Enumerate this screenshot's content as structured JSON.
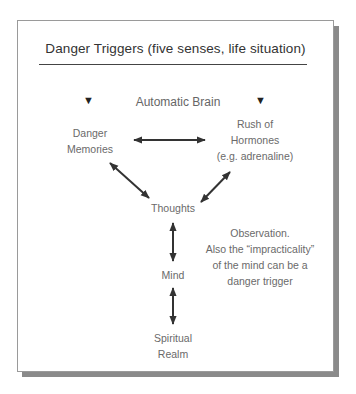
{
  "diagram": {
    "title": "Danger Triggers (five senses, life situation)",
    "section_label": "Automatic Brain",
    "marker_glyph": "▼",
    "nodes": {
      "danger_memories": [
        "Danger",
        "Memories"
      ],
      "rush_of_hormones": [
        "Rush of",
        "Hormones",
        "(e.g. adrenaline)"
      ],
      "thoughts": "Thoughts",
      "mind": "Mind",
      "spiritual_realm": [
        "Spiritual",
        "Realm"
      ]
    },
    "observation": [
      "Observation.",
      "Also the “impracticality”",
      "of the mind can be a",
      "danger trigger"
    ],
    "connections": [
      {
        "from": "danger_memories",
        "to": "rush_of_hormones",
        "type": "bidirectional"
      },
      {
        "from": "danger_memories",
        "to": "thoughts",
        "type": "bidirectional"
      },
      {
        "from": "rush_of_hormones",
        "to": "thoughts",
        "type": "bidirectional"
      },
      {
        "from": "thoughts",
        "to": "mind",
        "type": "bidirectional"
      },
      {
        "from": "mind",
        "to": "spiritual_realm",
        "type": "bidirectional"
      }
    ],
    "colors": {
      "arrow": "#333333",
      "text": "#666666",
      "title": "#333333",
      "shadow": "#8a8a8a"
    }
  }
}
